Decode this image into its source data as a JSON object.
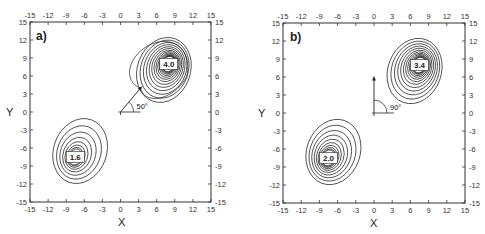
{
  "chart_data": [
    {
      "type": "contour",
      "panel_label": "a)",
      "xlabel": "X",
      "ylabel": "Y",
      "xlim": [
        -15,
        15
      ],
      "ylim": [
        -15,
        15
      ],
      "xticks": [
        -15,
        -12,
        -9,
        -6,
        -3,
        0,
        3,
        6,
        9,
        12,
        15
      ],
      "yticks": [
        -15,
        -12,
        -9,
        -6,
        -3,
        0,
        3,
        6,
        9,
        12,
        15
      ],
      "grid": false,
      "peaks": [
        {
          "x": 8,
          "y": 8,
          "label": "4.0",
          "levels": 14
        },
        {
          "x": -7.5,
          "y": -7.5,
          "label": "1.6",
          "levels": 8
        }
      ],
      "arrow": {
        "origin": [
          0,
          0
        ],
        "angle_deg": 50,
        "length": 5.5,
        "label": "50°"
      }
    },
    {
      "type": "contour",
      "panel_label": "b)",
      "xlabel": "X",
      "ylabel": "Y",
      "xlim": [
        -15,
        15
      ],
      "ylim": [
        -15,
        15
      ],
      "xticks": [
        -15,
        -12,
        -9,
        -6,
        -3,
        0,
        3,
        6,
        9,
        12,
        15
      ],
      "yticks": [
        -15,
        -12,
        -9,
        -6,
        -3,
        0,
        3,
        6,
        9,
        12,
        15
      ],
      "grid": false,
      "peaks": [
        {
          "x": 7.5,
          "y": 8,
          "label": "3.4",
          "levels": 13
        },
        {
          "x": -7.5,
          "y": -7.5,
          "label": "2.0",
          "levels": 10
        }
      ],
      "arrow": {
        "origin": [
          0,
          0
        ],
        "angle_deg": 90,
        "length": 6,
        "label": "90°"
      }
    }
  ],
  "panels": [
    {
      "label": "a)",
      "xlabel": "X",
      "ylabel": "Y",
      "peak1": "4.0",
      "peak2": "1.6",
      "angle": "50°"
    },
    {
      "label": "b)",
      "xlabel": "X",
      "ylabel": "Y",
      "peak1": "3.4",
      "peak2": "2.0",
      "angle": "90°"
    }
  ],
  "ticks": [
    "-15",
    "-12",
    "-9",
    "-6",
    "-3",
    "0",
    "3",
    "6",
    "9",
    "12",
    "15"
  ],
  "ticks_y": [
    "15",
    "12",
    "9",
    "6",
    "3",
    "0",
    "-3",
    "-6",
    "-9",
    "-12",
    "-15"
  ]
}
